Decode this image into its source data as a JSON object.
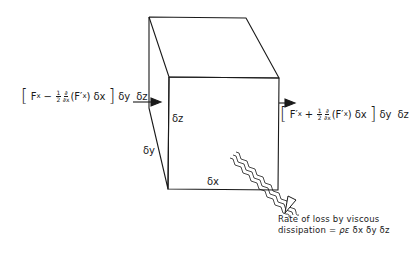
{
  "figure": {
    "type": "fluid-element-energy-balance"
  },
  "dimensions": {
    "dz": "δz",
    "dy": "δy",
    "dx": "δx"
  },
  "left_flux": {
    "open_bracket": "[",
    "term1": "F",
    "term1_sub": "x",
    "minus": "−",
    "half_num": "1",
    "half_den": "2",
    "deriv_num": "∂",
    "deriv_den": "∂x",
    "paren_term": "(F′",
    "paren_sub": "x",
    "paren_close": ")",
    "dx": "δx",
    "close_bracket": "]",
    "dy": "δy",
    "dz": "δz"
  },
  "right_flux": {
    "open_bracket": "[",
    "term1": "F′",
    "term1_sub": "x",
    "plus": "+",
    "half_num": "1",
    "half_den": "2",
    "deriv_num": "∂",
    "deriv_den": "∂x",
    "paren_term": "(F′",
    "paren_sub": "x",
    "paren_close": ")",
    "dx": "δx",
    "close_bracket": "]",
    "dy": "δy",
    "dz": "δz"
  },
  "dissipation_caption": {
    "line1": "Rate of loss by viscous",
    "line2_prefix": "dissipation = ",
    "line2_rho_eps": "ρε",
    "line2_terms": " δx δy δz"
  },
  "colors": {
    "line": "#1a1a1a",
    "background": "#ffffff"
  }
}
